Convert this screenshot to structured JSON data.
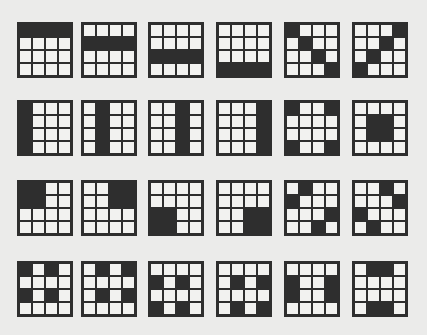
{
  "colors": {
    "filled": "#2e2e2e",
    "empty": "#f2f2f0",
    "background": "#ebebea"
  },
  "layout": {
    "col_x": [
      17,
      81,
      148,
      216,
      284,
      352
    ],
    "row_y": [
      22,
      100,
      180,
      261
    ]
  },
  "rows": [
    [
      [
        [
          0,
          0
        ],
        [
          0,
          1
        ],
        [
          0,
          2
        ],
        [
          0,
          3
        ]
      ],
      [
        [
          1,
          0
        ],
        [
          1,
          1
        ],
        [
          1,
          2
        ],
        [
          1,
          3
        ]
      ],
      [
        [
          2,
          0
        ],
        [
          2,
          1
        ],
        [
          2,
          2
        ],
        [
          2,
          3
        ]
      ],
      [
        [
          3,
          0
        ],
        [
          3,
          1
        ],
        [
          3,
          2
        ],
        [
          3,
          3
        ]
      ],
      [
        [
          0,
          0
        ],
        [
          1,
          1
        ],
        [
          2,
          2
        ],
        [
          3,
          3
        ]
      ],
      [
        [
          0,
          3
        ],
        [
          1,
          2
        ],
        [
          2,
          1
        ],
        [
          3,
          0
        ]
      ]
    ],
    [
      [
        [
          0,
          0
        ],
        [
          1,
          0
        ],
        [
          2,
          0
        ],
        [
          3,
          0
        ]
      ],
      [
        [
          0,
          1
        ],
        [
          1,
          1
        ],
        [
          2,
          1
        ],
        [
          3,
          1
        ]
      ],
      [
        [
          0,
          2
        ],
        [
          1,
          2
        ],
        [
          2,
          2
        ],
        [
          3,
          2
        ]
      ],
      [
        [
          0,
          3
        ],
        [
          1,
          3
        ],
        [
          2,
          3
        ],
        [
          3,
          3
        ]
      ],
      [
        [
          0,
          0
        ],
        [
          0,
          3
        ],
        [
          3,
          0
        ],
        [
          3,
          3
        ]
      ],
      [
        [
          1,
          1
        ],
        [
          1,
          2
        ],
        [
          2,
          1
        ],
        [
          2,
          2
        ]
      ]
    ],
    [
      [
        [
          0,
          0
        ],
        [
          0,
          1
        ],
        [
          1,
          0
        ],
        [
          1,
          1
        ]
      ],
      [
        [
          0,
          2
        ],
        [
          0,
          3
        ],
        [
          1,
          2
        ],
        [
          1,
          3
        ]
      ],
      [
        [
          2,
          0
        ],
        [
          2,
          1
        ],
        [
          3,
          0
        ],
        [
          3,
          1
        ]
      ],
      [
        [
          2,
          2
        ],
        [
          2,
          3
        ],
        [
          3,
          2
        ],
        [
          3,
          3
        ]
      ],
      [
        [
          0,
          1
        ],
        [
          1,
          0
        ],
        [
          2,
          3
        ],
        [
          3,
          2
        ]
      ],
      [
        [
          0,
          2
        ],
        [
          1,
          3
        ],
        [
          2,
          0
        ],
        [
          3,
          1
        ]
      ]
    ],
    [
      [
        [
          0,
          0
        ],
        [
          0,
          2
        ],
        [
          2,
          0
        ],
        [
          2,
          2
        ]
      ],
      [
        [
          0,
          1
        ],
        [
          0,
          3
        ],
        [
          2,
          1
        ],
        [
          2,
          3
        ]
      ],
      [
        [
          1,
          0
        ],
        [
          1,
          2
        ],
        [
          3,
          0
        ],
        [
          3,
          2
        ]
      ],
      [
        [
          1,
          1
        ],
        [
          1,
          3
        ],
        [
          3,
          1
        ],
        [
          3,
          3
        ]
      ],
      [
        [
          1,
          0
        ],
        [
          2,
          0
        ],
        [
          1,
          3
        ],
        [
          2,
          3
        ]
      ],
      [
        [
          0,
          1
        ],
        [
          0,
          2
        ],
        [
          3,
          1
        ],
        [
          3,
          2
        ]
      ]
    ]
  ]
}
